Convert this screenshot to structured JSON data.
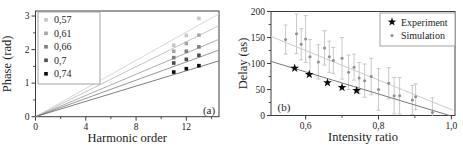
{
  "figure": {
    "background": "#ffffff",
    "frame_color": "#3c3c3c",
    "text_color": "#1c1c1c"
  },
  "chart_data": [
    {
      "panel": "a",
      "type": "scatter",
      "panel_label": "(a)",
      "xlabel": "Harmonic order",
      "ylabel": "Phase (rad)",
      "xlim": [
        0,
        14.6
      ],
      "ylim": [
        0,
        3.15
      ],
      "x_major_ticks": [
        0,
        4,
        8,
        12
      ],
      "x_major_tick_labels": [
        "0",
        "4",
        "8",
        "12"
      ],
      "x_minor_ticks": [
        2,
        6,
        10,
        14
      ],
      "y_major_ticks": [
        0,
        1,
        2,
        3
      ],
      "y_major_tick_labels": [
        "0",
        "1",
        "2",
        "3"
      ],
      "y_minor_ticks": [
        0.5,
        1.5,
        2.5
      ],
      "legend_position": "upper-left",
      "harmonic_orders": [
        11,
        12,
        13
      ],
      "series": [
        {
          "label": "0,57",
          "marker": "square",
          "marker_color": "#c6c6c6",
          "line_color": "#d4d4d4",
          "line_slope": 0.21,
          "phase": [
            2.13,
            2.42,
            2.93
          ]
        },
        {
          "label": "0,61",
          "marker": "square",
          "marker_color": "#a6a6a6",
          "line_color": "#bdbdbd",
          "line_slope": 0.186,
          "phase": [
            1.95,
            2.18,
            2.43
          ]
        },
        {
          "label": "0,66",
          "marker": "square",
          "marker_color": "#7d7d7d",
          "line_color": "#a3a3a3",
          "line_slope": 0.158,
          "phase": [
            1.76,
            1.95,
            2.08
          ]
        },
        {
          "label": "0,7",
          "marker": "square",
          "marker_color": "#4c4c4c",
          "line_color": "#8a8a8a",
          "line_slope": 0.136,
          "phase": [
            1.6,
            1.71,
            1.83
          ]
        },
        {
          "label": "0,74",
          "marker": "square",
          "marker_color": "#0a0a0a",
          "line_color": "#6f6f6f",
          "line_slope": 0.114,
          "phase": [
            1.33,
            1.43,
            1.52
          ]
        }
      ]
    },
    {
      "panel": "b",
      "type": "scatter",
      "panel_label": "(b)",
      "xlabel": "Intensity ratio",
      "ylabel": "Delay (as)",
      "xlim": [
        0.505,
        1.01
      ],
      "ylim": [
        0,
        200
      ],
      "x_major_ticks": [
        0.6,
        0.8,
        1.0
      ],
      "x_major_tick_labels": [
        "0,6",
        "0,8",
        "1,0"
      ],
      "x_minor_ticks": [
        0.7,
        0.9
      ],
      "y_major_ticks": [
        0,
        50,
        100,
        150,
        200
      ],
      "y_major_tick_labels": [
        "0",
        "50",
        "100",
        "150",
        "200"
      ],
      "y_minor_ticks": [
        25,
        75,
        125,
        175
      ],
      "legend_position": "upper-right",
      "series": [
        {
          "label": "Experiment",
          "marker": "star",
          "color": "#0a0a0a",
          "points_xy": [
            [
              0.57,
              91
            ],
            [
              0.61,
              79
            ],
            [
              0.66,
              63
            ],
            [
              0.7,
              54
            ],
            [
              0.74,
              48
            ]
          ],
          "fit_line": {
            "x1": 0.505,
            "y1": 104,
            "x2": 0.995,
            "y2": 0,
            "color": "#7a7a7a"
          }
        },
        {
          "label": "Simulation",
          "marker": "dot",
          "color": "#8f8f8f",
          "errorbar_color": "#c3c3c3",
          "points_xye": [
            [
              0.545,
              146,
              28
            ],
            [
              0.575,
              157,
              38
            ],
            [
              0.588,
              137,
              30
            ],
            [
              0.6,
              147,
              45
            ],
            [
              0.612,
              113,
              33
            ],
            [
              0.635,
              103,
              33
            ],
            [
              0.652,
              130,
              33
            ],
            [
              0.665,
              113,
              30
            ],
            [
              0.676,
              106,
              25
            ],
            [
              0.7,
              110,
              40
            ],
            [
              0.718,
              83,
              33
            ],
            [
              0.733,
              93,
              25
            ],
            [
              0.747,
              72,
              30
            ],
            [
              0.762,
              67,
              32
            ],
            [
              0.78,
              75,
              35
            ],
            [
              0.8,
              50,
              40
            ],
            [
              0.828,
              62,
              30
            ],
            [
              0.843,
              38,
              35
            ],
            [
              0.858,
              38,
              35
            ],
            [
              0.893,
              30,
              28
            ],
            [
              0.902,
              36,
              25
            ],
            [
              0.948,
              6,
              28
            ]
          ],
          "fit_line": {
            "x1": 0.505,
            "y1": 152,
            "x2": 1.005,
            "y2": 10,
            "color": "#cccccc"
          }
        }
      ]
    }
  ]
}
